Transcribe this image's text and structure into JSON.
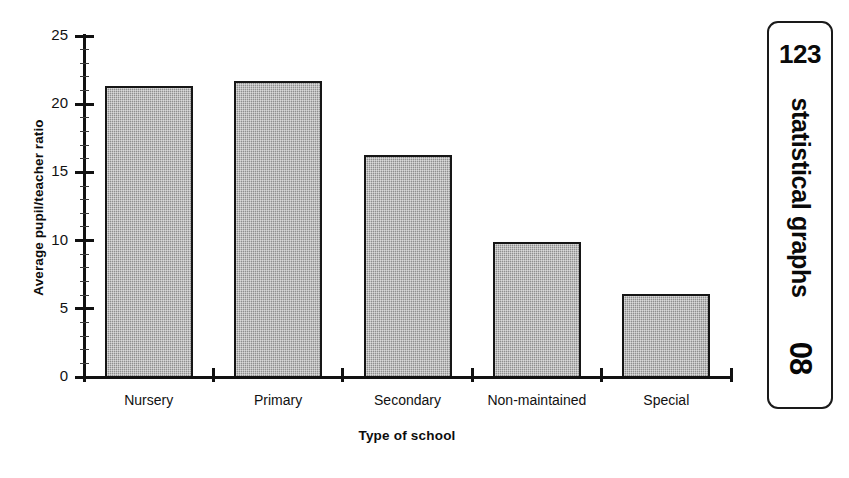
{
  "chart_data": {
    "type": "bar",
    "title": "",
    "xlabel": "Type of school",
    "ylabel": "Average pupil/teacher ratio",
    "categories": [
      "Nursery",
      "Primary",
      "Secondary",
      "Non-maintained",
      "Special"
    ],
    "values": [
      21.3,
      21.7,
      16.3,
      9.9,
      6.1
    ],
    "ylim": [
      0,
      25
    ],
    "yticks": [
      0,
      5,
      10,
      15,
      20,
      25
    ],
    "ytick_labels": [
      "0",
      "5",
      "10",
      "15",
      "20",
      "25"
    ],
    "minor_tick_interval": 1,
    "grid": false,
    "legend": null,
    "bar_fill_color": "#9e9e9e",
    "bar_edge_color": "#161616",
    "axis_color": "#111111",
    "background_color": "#ffffff"
  },
  "sidebar": {
    "number": "123",
    "section_label": "statistical graphs",
    "page_number": "08",
    "border_color": "#1a1a1a"
  }
}
